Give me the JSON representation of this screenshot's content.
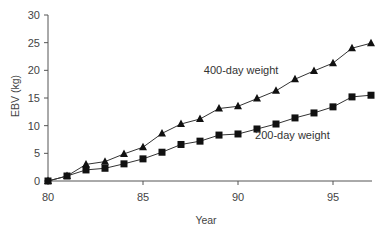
{
  "chart_data": {
    "type": "line",
    "title": "",
    "xlabel": "Year",
    "ylabel": "EBV (kg)",
    "xlim": [
      80,
      97
    ],
    "ylim": [
      0,
      30
    ],
    "x_ticks": [
      80,
      85,
      90,
      95
    ],
    "y_ticks": [
      0,
      5,
      10,
      15,
      20,
      25,
      30
    ],
    "grid": false,
    "legend": "inline labels",
    "x": [
      80,
      81,
      82,
      83,
      84,
      85,
      86,
      87,
      88,
      89,
      90,
      91,
      92,
      93,
      94,
      95,
      96,
      97
    ],
    "series": [
      {
        "name": "400-day weight",
        "marker": "triangle",
        "values": [
          0,
          0.9,
          3.0,
          3.5,
          4.9,
          6.1,
          8.6,
          10.3,
          11.2,
          13.1,
          13.5,
          14.9,
          16.3,
          18.4,
          19.9,
          21.3,
          24.0,
          24.9
        ]
      },
      {
        "name": "200-day weight",
        "marker": "square",
        "values": [
          0,
          0.9,
          2.0,
          2.3,
          3.1,
          4.0,
          5.2,
          6.6,
          7.2,
          8.3,
          8.5,
          9.4,
          10.3,
          11.4,
          12.3,
          13.4,
          15.2,
          15.5
        ]
      }
    ],
    "annotations": [
      {
        "text": "400-day weight",
        "x": 88.2,
        "y": 19.4
      },
      {
        "text": "200-day weight",
        "x": 90.9,
        "y": 7.6
      }
    ]
  },
  "colors": {
    "line": "#333333",
    "marker": "#111111",
    "axis": "#555555",
    "background": "#ffffff"
  }
}
